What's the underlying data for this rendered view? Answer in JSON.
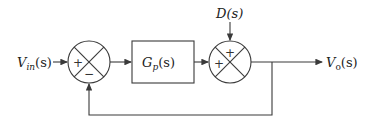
{
  "diagram": {
    "type": "feedback-control-block-diagram",
    "input": {
      "label": "V",
      "sub": "in",
      "arg": "(s)"
    },
    "output": {
      "label": "V",
      "sub": "o",
      "arg": "(s)"
    },
    "disturbance": {
      "label": "D(s)"
    },
    "plant": {
      "label": "G",
      "sub": "p",
      "arg": "(s)"
    },
    "summer1": {
      "signs": {
        "left": "+",
        "bottom": "−"
      }
    },
    "summer2": {
      "signs": {
        "top": "+",
        "left": "+"
      }
    },
    "colors": {
      "line": "#3a3a3a",
      "text": "#222222",
      "background": "#ffffff"
    }
  }
}
